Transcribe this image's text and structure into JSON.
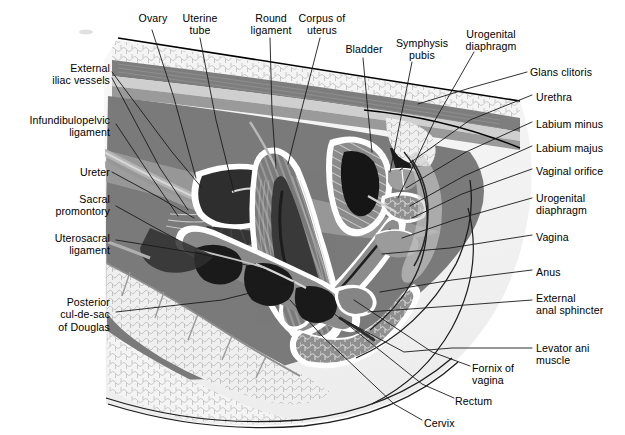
{
  "figure": {
    "kind": "anatomical-illustration",
    "style": "grayscale line-and-tone medical illustration",
    "colors": {
      "background": "#ffffff",
      "outline": "#000000",
      "leader_line": "#1a1a1a",
      "fat_fill": "#f2f2f2",
      "fat_cells": "#b9b9b9",
      "muscle_mid": "#8d8d8d",
      "muscle_dark": "#6f6f6f",
      "muscle_light": "#b0b0b0",
      "cavity_dark": "#2b2b2b",
      "cavity_black": "#141414",
      "highlight": "#ffffff",
      "thigh_shadow": "#d8d8d8",
      "bone_fill": "#e8e8e8",
      "skin_tone": "#cfcfcf"
    }
  },
  "labels_top": [
    {
      "id": "ovary",
      "text": "Ovary",
      "x": 131,
      "y": 12,
      "align": "center",
      "w": 44
    },
    {
      "id": "uterine-tube",
      "text": "Uterine\ntube",
      "x": 176,
      "y": 12,
      "align": "center",
      "w": 48
    },
    {
      "id": "round-ligament",
      "text": "Round\nligament",
      "x": 243,
      "y": 12,
      "align": "center",
      "w": 56
    },
    {
      "id": "corpus-uteri",
      "text": "Corpus of\nuterus",
      "x": 294,
      "y": 12,
      "align": "center",
      "w": 56
    },
    {
      "id": "bladder",
      "text": "Bladder",
      "x": 340,
      "y": 43,
      "align": "center",
      "w": 48
    },
    {
      "id": "symphysis-pubis",
      "text": "Symphysis\npubis",
      "x": 392,
      "y": 37,
      "align": "center",
      "w": 60
    },
    {
      "id": "urogenital-diaphragm-top",
      "text": "Urogenital\ndiaphragm",
      "x": 460,
      "y": 28,
      "align": "center",
      "w": 62
    },
    {
      "id": "glans-clitoris",
      "text": "Glans clitoris",
      "x": 530,
      "y": 66,
      "align": "left",
      "w": 86
    }
  ],
  "labels_left": [
    {
      "id": "external-iliac-vessels",
      "text": "External\niliac vessels",
      "x": 18,
      "y": 62,
      "align": "right",
      "w": 92
    },
    {
      "id": "infundibulopelvic-ligament",
      "text": "Infundibulopelvic\nligament",
      "x": 8,
      "y": 114,
      "align": "right",
      "w": 102
    },
    {
      "id": "ureter",
      "text": "Ureter",
      "x": 32,
      "y": 166,
      "align": "right",
      "w": 78
    },
    {
      "id": "sacral-promontory",
      "text": "Sacral\npromontory",
      "x": 18,
      "y": 193,
      "align": "right",
      "w": 92
    },
    {
      "id": "uterosacral-ligament",
      "text": "Uterosacral\nligament",
      "x": 12,
      "y": 232,
      "align": "right",
      "w": 98
    },
    {
      "id": "posterior-cul-de-sac",
      "text": "Posterior\ncul-de-sac\nof Douglas",
      "x": 18,
      "y": 296,
      "align": "right",
      "w": 92
    }
  ],
  "labels_right": [
    {
      "id": "urethra",
      "text": "Urethra",
      "x": 536,
      "y": 91,
      "align": "left",
      "w": 86
    },
    {
      "id": "labium-minus",
      "text": "Labium minus",
      "x": 536,
      "y": 118,
      "align": "left",
      "w": 86
    },
    {
      "id": "labium-majus",
      "text": "Labium majus",
      "x": 536,
      "y": 142,
      "align": "left",
      "w": 86
    },
    {
      "id": "vaginal-orifice",
      "text": "Vaginal orifice",
      "x": 536,
      "y": 165,
      "align": "left",
      "w": 86
    },
    {
      "id": "urogenital-diaphragm-right",
      "text": "Urogenital\ndiaphragm",
      "x": 536,
      "y": 192,
      "align": "left",
      "w": 86
    },
    {
      "id": "vagina",
      "text": "Vagina",
      "x": 536,
      "y": 231,
      "align": "left",
      "w": 86
    },
    {
      "id": "anus",
      "text": "Anus",
      "x": 536,
      "y": 266,
      "align": "left",
      "w": 86
    },
    {
      "id": "external-anal-sphincter",
      "text": "External\nanal sphincter",
      "x": 536,
      "y": 292,
      "align": "left",
      "w": 88
    },
    {
      "id": "levator-ani-muscle",
      "text": "Levator ani\nmuscle",
      "x": 536,
      "y": 342,
      "align": "left",
      "w": 86
    }
  ],
  "labels_bottom": [
    {
      "id": "fornix-of-vagina",
      "text": "Fornix of\nvagina",
      "x": 472,
      "y": 362,
      "align": "left",
      "w": 64
    },
    {
      "id": "rectum",
      "text": "Rectum",
      "x": 455,
      "y": 395,
      "align": "left",
      "w": 64
    },
    {
      "id": "cervix",
      "text": "Cervix",
      "x": 424,
      "y": 417,
      "align": "left",
      "w": 64
    }
  ],
  "leaders": {
    "note": "thin black leader lines joining each label to its anatomical structure",
    "top": [
      {
        "id": "ovary",
        "points": "152,30 174,98 194,178"
      },
      {
        "id": "uterine-tube",
        "points": "200,38 215,120 232,192"
      },
      {
        "id": "round-ligament",
        "points": "270,38 272,110 276,170"
      },
      {
        "id": "corpus-uteri",
        "points": "318,38 300,110 287,164"
      },
      {
        "id": "bladder",
        "points": "363,58 368,110 372,152"
      },
      {
        "id": "symphysis-pubis",
        "points": "410,62 400,120 390,178"
      },
      {
        "id": "ugd-top",
        "points": "472,52 432,120 396,198"
      },
      {
        "id": "glans-clitoris",
        "points": "525,72 470,88 418,104"
      }
    ],
    "left": [
      {
        "id": "external-iliac-1",
        "points": "112,72 170,152 200,188"
      },
      {
        "id": "external-iliac-2",
        "points": "112,78 160,168 186,208"
      },
      {
        "id": "infundibulopelvic",
        "points": "114,124 150,178 176,216"
      },
      {
        "id": "ureter",
        "points": "112,172 160,198 192,216"
      },
      {
        "id": "sacral-promontory",
        "points": "114,206 152,226 176,238"
      },
      {
        "id": "uterosacral",
        "points": "114,240 200,254 264,268"
      },
      {
        "id": "posterior-cul-de-sac",
        "points": "114,312 220,300 292,282"
      }
    ],
    "right": [
      {
        "id": "urethra",
        "points": "530,95 468,120 398,170"
      },
      {
        "id": "labium-minus",
        "points": "530,122 464,152 404,188"
      },
      {
        "id": "labium-majus",
        "points": "530,146 462,176 408,206"
      },
      {
        "id": "vaginal-orifice",
        "points": "530,169 460,194 410,218"
      },
      {
        "id": "ugd-right",
        "points": "530,198 452,220 400,238"
      },
      {
        "id": "vagina",
        "points": "530,235 448,248 380,254"
      },
      {
        "id": "anus",
        "points": "530,270 450,280 378,292"
      },
      {
        "id": "external-anal-sphincter",
        "points": "530,300 450,306 366,312"
      },
      {
        "id": "levator-ani",
        "points": "530,348 450,348 400,352 346,322"
      }
    ],
    "bottom": [
      {
        "id": "fornix-of-vagina",
        "points": "468,366 430,352 352,300"
      },
      {
        "id": "rectum",
        "points": "452,398 420,384 330,312 300,296"
      },
      {
        "id": "cervix",
        "points": "420,420 392,404 320,336 288,300"
      }
    ]
  }
}
